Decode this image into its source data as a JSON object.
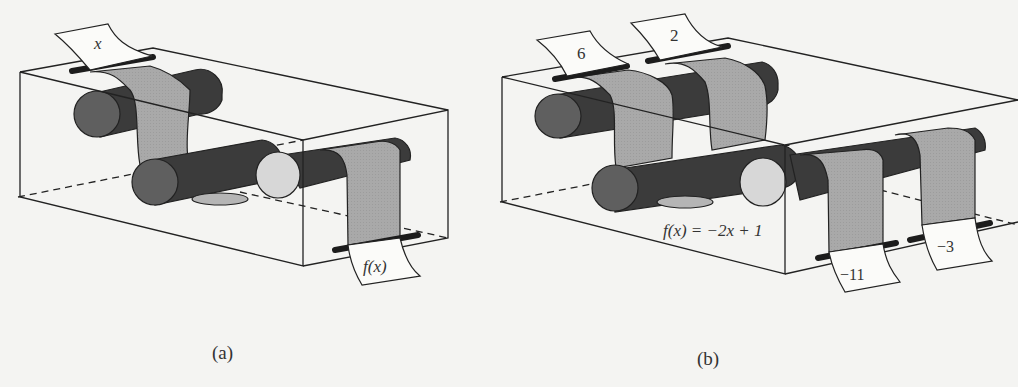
{
  "figure": {
    "panel_a": {
      "caption": "(a)",
      "input_label": "x",
      "output_label": "f(x)"
    },
    "panel_b": {
      "caption": "(b)",
      "inputs": [
        "6",
        "2"
      ],
      "outputs": [
        "−11",
        "−3"
      ],
      "rule": "f(x) = −2x + 1"
    }
  },
  "colors": {
    "background": "#f4f4f2",
    "line": "#222222",
    "paper": "#fbfbf9",
    "paper_gray": "#a9a9a9",
    "roller_dark": "#3b3b3b",
    "roller_end": "#5f5f5f",
    "roller_light": "#d7d7d7",
    "slot": "#1c1c1c"
  }
}
